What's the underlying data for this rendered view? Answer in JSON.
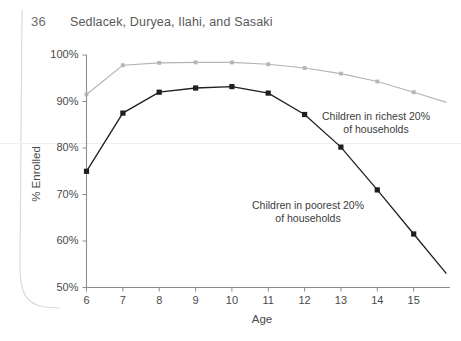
{
  "header": {
    "page_number": "36",
    "running_head": "Sedlacek, Duryea, Ilahi, and Sasaki"
  },
  "chart_data": {
    "type": "line",
    "title": "",
    "xlabel": "Age",
    "ylabel": "% Enrolled",
    "x": [
      6,
      7,
      8,
      9,
      10,
      11,
      12,
      13,
      14,
      15
    ],
    "xticklabels": [
      "6",
      "7",
      "8",
      "9",
      "10",
      "11",
      "12",
      "13",
      "14",
      "15"
    ],
    "yticklabels": [
      "50%",
      "60%",
      "70%",
      "80%",
      "90%",
      "100%"
    ],
    "yticks": [
      50,
      60,
      70,
      80,
      90,
      100
    ],
    "xlim": [
      6,
      16
    ],
    "ylim": [
      50,
      100
    ],
    "grid": false,
    "legend_position": "inline-annotations",
    "series": [
      {
        "name": "Children in richest 20% of households",
        "color": "#b4b4b4",
        "marker": "square-small",
        "values": [
          91.5,
          97.8,
          98.3,
          98.4,
          98.4,
          98.0,
          97.2,
          96.0,
          94.3,
          92.0
        ],
        "tail_x": 15.9,
        "tail_value": 89.8
      },
      {
        "name": "Children in poorest 20% of households",
        "color": "#1f1f1f",
        "marker": "square",
        "values": [
          75.0,
          87.5,
          92.0,
          92.9,
          93.2,
          91.8,
          87.2,
          80.2,
          71.0,
          61.5
        ],
        "tail_x": 15.9,
        "tail_value": 53.0
      }
    ],
    "annotations": [
      {
        "id": "rich",
        "line1": "Children in richest 20%",
        "line2": "of households"
      },
      {
        "id": "poor",
        "line1": "Children in poorest 20%",
        "line2": "of households"
      }
    ]
  }
}
